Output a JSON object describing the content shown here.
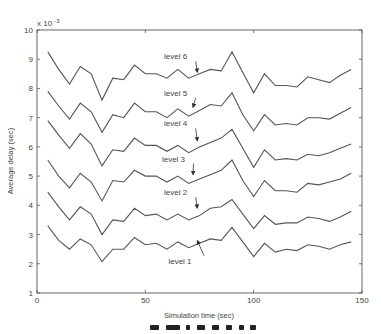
{
  "chart_data": {
    "type": "line",
    "title": "",
    "xlabel": "Simulation time (sec)",
    "ylabel": "Average delay (sec)",
    "y_exponent_label": "x 10",
    "y_exponent": "-3",
    "xlim": [
      0,
      150
    ],
    "ylim": [
      1,
      10
    ],
    "x_ticks": [
      0,
      50,
      100,
      150
    ],
    "y_ticks": [
      1,
      2,
      3,
      4,
      5,
      6,
      7,
      8,
      9,
      10
    ],
    "grid": false,
    "legend": "inline annotations with arrows",
    "line_color": "#555555",
    "x": [
      5,
      10,
      15,
      20,
      25,
      30,
      35,
      40,
      45,
      50,
      55,
      60,
      65,
      70,
      75,
      80,
      85,
      90,
      95,
      100,
      105,
      110,
      115,
      120,
      125,
      130,
      135,
      140,
      145
    ],
    "series": [
      {
        "name": "level 1",
        "values": [
          3.3,
          2.8,
          2.5,
          2.85,
          2.65,
          2.07,
          2.5,
          2.5,
          2.9,
          2.65,
          2.7,
          2.5,
          2.75,
          2.55,
          2.7,
          2.85,
          2.8,
          3.25,
          2.75,
          2.25,
          2.7,
          2.4,
          2.5,
          2.45,
          2.65,
          2.6,
          2.5,
          2.65,
          2.75
        ]
      },
      {
        "name": "level 2",
        "values": [
          4.45,
          3.95,
          3.5,
          3.95,
          3.7,
          3.0,
          3.5,
          3.45,
          3.9,
          3.65,
          3.7,
          3.5,
          3.7,
          3.5,
          3.65,
          3.9,
          3.95,
          4.2,
          3.7,
          3.2,
          3.65,
          3.35,
          3.4,
          3.4,
          3.6,
          3.55,
          3.45,
          3.6,
          3.8
        ]
      },
      {
        "name": "level 3",
        "values": [
          5.55,
          5.0,
          4.6,
          5.1,
          4.8,
          4.15,
          4.85,
          4.8,
          5.2,
          5.0,
          5.0,
          4.8,
          5.0,
          4.75,
          4.9,
          5.05,
          5.2,
          5.55,
          4.85,
          4.3,
          4.85,
          4.5,
          4.5,
          4.45,
          4.75,
          4.7,
          4.8,
          4.9,
          5.1
        ]
      },
      {
        "name": "level 4",
        "values": [
          6.9,
          6.4,
          5.95,
          6.45,
          6.1,
          5.35,
          5.9,
          5.85,
          6.3,
          6.05,
          6.05,
          5.85,
          6.05,
          5.8,
          6.0,
          6.15,
          6.3,
          6.6,
          5.95,
          5.3,
          5.9,
          5.55,
          5.6,
          5.55,
          5.75,
          5.7,
          5.8,
          5.95,
          6.1
        ]
      },
      {
        "name": "level 5",
        "values": [
          7.9,
          7.4,
          6.95,
          7.5,
          7.2,
          6.5,
          7.1,
          7.0,
          7.5,
          7.2,
          7.2,
          7.0,
          7.3,
          7.05,
          7.25,
          7.45,
          7.4,
          7.85,
          7.1,
          6.55,
          7.1,
          6.75,
          6.8,
          6.75,
          7.0,
          7.0,
          6.95,
          7.15,
          7.35
        ]
      },
      {
        "name": "level 6",
        "values": [
          9.25,
          8.65,
          8.15,
          8.75,
          8.5,
          7.6,
          8.35,
          8.3,
          8.8,
          8.5,
          8.5,
          8.35,
          8.65,
          8.35,
          8.5,
          8.65,
          8.6,
          9.25,
          8.55,
          7.85,
          8.5,
          8.1,
          8.1,
          8.05,
          8.4,
          8.3,
          8.2,
          8.45,
          8.65
        ]
      }
    ],
    "annotations": [
      {
        "text": "level 6",
        "label_x": 64,
        "label_y": 9.0,
        "arrow_to_x": 74,
        "arrow_to_y": 8.55
      },
      {
        "text": "level 5",
        "label_x": 64,
        "label_y": 7.75,
        "arrow_to_x": 72,
        "arrow_to_y": 7.35
      },
      {
        "text": "level 4",
        "label_x": 64,
        "label_y": 6.7,
        "arrow_to_x": 74,
        "arrow_to_y": 6.2
      },
      {
        "text": "level 3",
        "label_x": 63,
        "label_y": 5.5,
        "arrow_to_x": 72,
        "arrow_to_y": 5.05
      },
      {
        "text": "level 2",
        "label_x": 64,
        "label_y": 4.35,
        "arrow_to_x": 74,
        "arrow_to_y": 3.9
      },
      {
        "text": "level 1",
        "label_x": 66,
        "label_y": 2.0,
        "arrow_to_x": 74,
        "arrow_to_y": 2.8
      }
    ]
  },
  "caption": {
    "visible_fragment": "partially cut-off caption text"
  }
}
